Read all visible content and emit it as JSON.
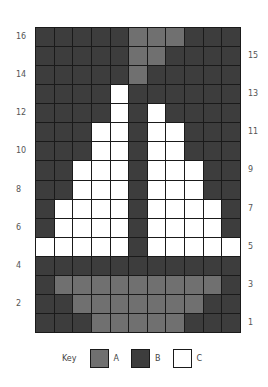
{
  "diagram": {
    "type": "knitting-colorwork-chart",
    "columns": 11,
    "rows": 16,
    "colors": {
      "A": "#707070",
      "B": "#3d3d3d",
      "C": "#ffffff",
      "gridline": "#1a1a1a"
    },
    "grid_rows_top_to_bottom": [
      {
        "row": 16,
        "cells": [
          "B",
          "B",
          "B",
          "B",
          "B",
          "A",
          "A",
          "A",
          "B",
          "B",
          "B"
        ]
      },
      {
        "row": 15,
        "cells": [
          "B",
          "B",
          "B",
          "B",
          "B",
          "A",
          "A",
          "B",
          "B",
          "B",
          "B"
        ]
      },
      {
        "row": 14,
        "cells": [
          "B",
          "B",
          "B",
          "B",
          "B",
          "A",
          "B",
          "B",
          "B",
          "B",
          "B"
        ]
      },
      {
        "row": 13,
        "cells": [
          "B",
          "B",
          "B",
          "B",
          "C",
          "B",
          "B",
          "B",
          "B",
          "B",
          "B"
        ]
      },
      {
        "row": 12,
        "cells": [
          "B",
          "B",
          "B",
          "B",
          "C",
          "B",
          "C",
          "B",
          "B",
          "B",
          "B"
        ]
      },
      {
        "row": 11,
        "cells": [
          "B",
          "B",
          "B",
          "C",
          "C",
          "B",
          "C",
          "C",
          "B",
          "B",
          "B"
        ]
      },
      {
        "row": 10,
        "cells": [
          "B",
          "B",
          "B",
          "C",
          "C",
          "B",
          "C",
          "C",
          "B",
          "B",
          "B"
        ]
      },
      {
        "row": 9,
        "cells": [
          "B",
          "B",
          "C",
          "C",
          "C",
          "B",
          "C",
          "C",
          "C",
          "B",
          "B"
        ]
      },
      {
        "row": 8,
        "cells": [
          "B",
          "B",
          "C",
          "C",
          "C",
          "B",
          "C",
          "C",
          "C",
          "B",
          "B"
        ]
      },
      {
        "row": 7,
        "cells": [
          "B",
          "C",
          "C",
          "C",
          "C",
          "B",
          "C",
          "C",
          "C",
          "C",
          "B"
        ]
      },
      {
        "row": 6,
        "cells": [
          "B",
          "C",
          "C",
          "C",
          "C",
          "B",
          "C",
          "C",
          "C",
          "C",
          "B"
        ]
      },
      {
        "row": 5,
        "cells": [
          "C",
          "C",
          "C",
          "C",
          "C",
          "B",
          "C",
          "C",
          "C",
          "C",
          "C"
        ]
      },
      {
        "row": 4,
        "cells": [
          "B",
          "B",
          "B",
          "B",
          "B",
          "B",
          "B",
          "B",
          "B",
          "B",
          "B"
        ]
      },
      {
        "row": 3,
        "cells": [
          "B",
          "A",
          "A",
          "A",
          "A",
          "A",
          "A",
          "A",
          "A",
          "A",
          "B"
        ]
      },
      {
        "row": 2,
        "cells": [
          "B",
          "B",
          "A",
          "A",
          "A",
          "A",
          "A",
          "A",
          "A",
          "B",
          "B"
        ]
      },
      {
        "row": 1,
        "cells": [
          "B",
          "B",
          "B",
          "A",
          "A",
          "A",
          "A",
          "A",
          "B",
          "B",
          "B"
        ]
      }
    ],
    "row_labels_left": [
      "16",
      "14",
      "12",
      "10",
      "8",
      "6",
      "4",
      "2"
    ],
    "row_labels_right": [
      "15",
      "13",
      "11",
      "9",
      "7",
      "5",
      "3",
      "1"
    ]
  },
  "key": {
    "title": "Key",
    "items": [
      {
        "id": "A",
        "label": "A"
      },
      {
        "id": "B",
        "label": "B"
      },
      {
        "id": "C",
        "label": "C"
      }
    ]
  }
}
